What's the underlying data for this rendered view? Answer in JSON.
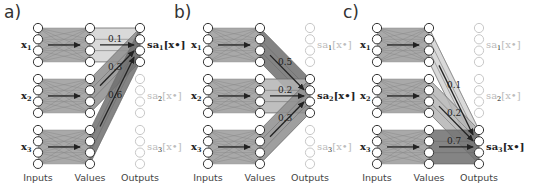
{
  "figure": {
    "column_labels": [
      "Inputs",
      "Values",
      "Outputs"
    ],
    "input_labels": [
      "x",
      "x",
      "x"
    ],
    "input_subscripts": [
      "1",
      "2",
      "3"
    ],
    "output_prefix": "sa",
    "output_suffix": "[x•]",
    "output_subscripts": [
      "1",
      "2",
      "3"
    ],
    "nodes_per_group": 4,
    "colors": {
      "block": "#a9a9a9",
      "block_dark": "#6f6f6f",
      "block_light": "#d2d2d2",
      "arrow": "#222222",
      "node_stroke": "#333333",
      "dim_node_stroke": "#c8c8c8",
      "dim_text": "#bbbbbb"
    }
  },
  "panels": [
    {
      "letter": "a)",
      "active_output": 0,
      "weights": [
        {
          "from": 0,
          "value": "0.1"
        },
        {
          "from": 1,
          "value": "0.3"
        },
        {
          "from": 2,
          "value": "0.6"
        }
      ]
    },
    {
      "letter": "b)",
      "active_output": 1,
      "weights": [
        {
          "from": 0,
          "value": "0.5"
        },
        {
          "from": 1,
          "value": "0.2"
        },
        {
          "from": 2,
          "value": "0.3"
        }
      ]
    },
    {
      "letter": "c)",
      "active_output": 2,
      "weights": [
        {
          "from": 0,
          "value": "0.1"
        },
        {
          "from": 1,
          "value": "0.2"
        },
        {
          "from": 2,
          "value": "0.7"
        }
      ]
    }
  ]
}
